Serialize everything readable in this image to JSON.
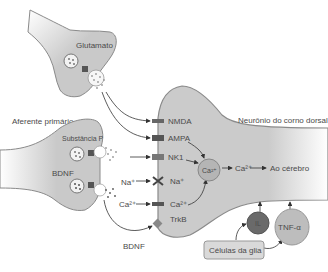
{
  "diagram": {
    "type": "pain-pathway-synapse",
    "language": "pt-BR",
    "labels": {
      "glutamato": "Glutamato",
      "aferente_primario": "Aferente primário",
      "substancia_p": "Substância P",
      "bdnf_vesicle": "BDNF",
      "bdnf_arrow": "BDNF",
      "na_ion_outside": "Na⁺",
      "ca_ion_outside": "Ca²⁺",
      "neuron": "Neurônio do corno dorsal",
      "to_brain": "Ao cérebro",
      "ca_inside": "Ca²⁺",
      "ca_circle": "Ca²⁺",
      "glia": "Células da glia",
      "il": "IL",
      "tnf": "TNF-α"
    },
    "receptors": [
      {
        "label": "NMDA"
      },
      {
        "label": "AMPA"
      },
      {
        "label": "NK1"
      },
      {
        "label": "Na⁺"
      },
      {
        "label": "Ca²⁺"
      },
      {
        "label": "TrkB"
      }
    ],
    "colors": {
      "cell_fill": "#c9c9c9",
      "cell_stroke": "#8a8a8a",
      "receptor_dark": "#555555",
      "il_circle": "#6a6a6a",
      "tnf_circle": "#bdbdbd",
      "text": "#4a4a4a"
    }
  }
}
